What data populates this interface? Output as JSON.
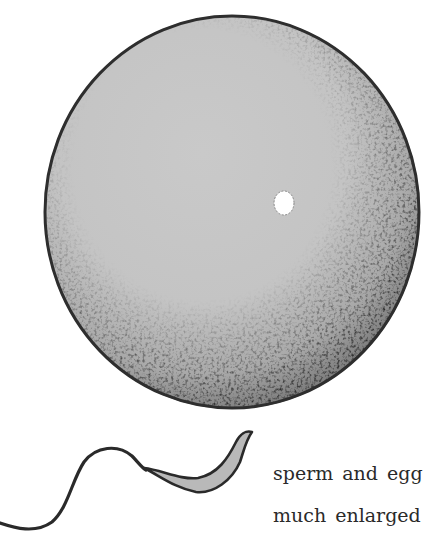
{
  "figure": {
    "caption": {
      "line1": "sperm and egg",
      "line2": "much enlarged"
    },
    "egg": {
      "label": "egg",
      "center": [
        232,
        212
      ],
      "radius_x": 188,
      "radius_y": 197,
      "fill": "#c8c8c8",
      "outline": "#2e2e2e",
      "nucleus_fill": "#ffffff"
    },
    "sperm": {
      "label": "sperm",
      "head_fill": "#b9b9b9",
      "outline": "#2a2a2a"
    }
  }
}
